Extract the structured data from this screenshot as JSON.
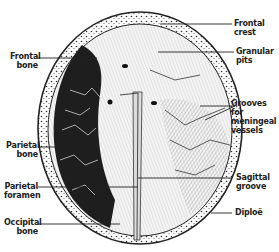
{
  "figure": {
    "colors": {
      "ink": "#222222",
      "background": "#ffffff",
      "dark_fill": "#1e1e1e",
      "light_fill": "#e8e8e8"
    },
    "labels_left": [
      {
        "id": "frontal-bone",
        "line1": "Frontal",
        "line2": "bone"
      },
      {
        "id": "parietal-bone",
        "line1": "Parietal",
        "line2": "bone"
      },
      {
        "id": "parietal-foramen",
        "line1": "Parietal",
        "line2": "foramen"
      },
      {
        "id": "occipital-bone",
        "line1": "Occipital",
        "line2": "bone"
      }
    ],
    "labels_right": [
      {
        "id": "frontal-crest",
        "line1": "Frontal",
        "line2": "crest"
      },
      {
        "id": "granular-pits",
        "line1": "Granular",
        "line2": "pits"
      },
      {
        "id": "grooves-meningeal",
        "line1": "Grooves for",
        "line2": "meningeal",
        "line3": "vessels"
      },
      {
        "id": "sagittal-groove",
        "line1": "Sagittal",
        "line2": "groove"
      },
      {
        "id": "diploe",
        "line1": "Diploë"
      }
    ]
  }
}
